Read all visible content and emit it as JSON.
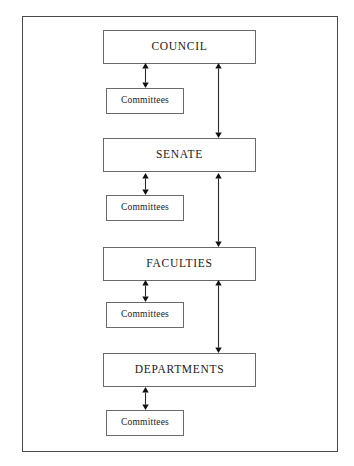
{
  "diagram": {
    "type": "organizational-hierarchy",
    "frame": {
      "border_color": "#4a4a4a",
      "background": "#ffffff"
    },
    "colors": {
      "box_border": "#6a6a6a",
      "frame_border": "#4a4a4a",
      "arrow": "#2b2b2b",
      "text": "#1a1a1a",
      "background": "#ffffff"
    },
    "nodes": [
      {
        "id": "council",
        "label": "COUNCIL",
        "kind": "primary",
        "top": 30
      },
      {
        "id": "committees-1",
        "label": "Committees",
        "kind": "committee",
        "top": 88
      },
      {
        "id": "senate",
        "label": "SENATE",
        "kind": "primary",
        "top": 138
      },
      {
        "id": "committees-2",
        "label": "Committees",
        "kind": "committee",
        "top": 195
      },
      {
        "id": "faculties",
        "label": "FACULTIES",
        "kind": "primary",
        "top": 247
      },
      {
        "id": "committees-3",
        "label": "Committees",
        "kind": "committee",
        "top": 302
      },
      {
        "id": "departments",
        "label": "DEPARTMENTS",
        "kind": "primary",
        "top": 353
      },
      {
        "id": "committees-4",
        "label": "Committees",
        "kind": "committee",
        "top": 410
      }
    ],
    "connectors": [
      {
        "id": "council-committees",
        "from": "council",
        "to": "committees-1",
        "direction": "bidirectional",
        "x": 145,
        "top": 63,
        "height": 25
      },
      {
        "id": "council-senate",
        "from": "council",
        "to": "senate",
        "direction": "bidirectional",
        "x": 218,
        "top": 63,
        "height": 75
      },
      {
        "id": "senate-committees",
        "from": "senate",
        "to": "committees-2",
        "direction": "bidirectional",
        "x": 145,
        "top": 173,
        "height": 22
      },
      {
        "id": "senate-faculties",
        "from": "senate",
        "to": "faculties",
        "direction": "bidirectional",
        "x": 218,
        "top": 173,
        "height": 74
      },
      {
        "id": "faculties-committees",
        "from": "faculties",
        "to": "committees-3",
        "direction": "bidirectional",
        "x": 145,
        "top": 280,
        "height": 22
      },
      {
        "id": "faculties-departments",
        "from": "faculties",
        "to": "departments",
        "direction": "bidirectional",
        "x": 218,
        "top": 280,
        "height": 73
      },
      {
        "id": "departments-committees",
        "from": "departments",
        "to": "committees-4",
        "direction": "bidirectional",
        "x": 145,
        "top": 387,
        "height": 23
      }
    ]
  }
}
